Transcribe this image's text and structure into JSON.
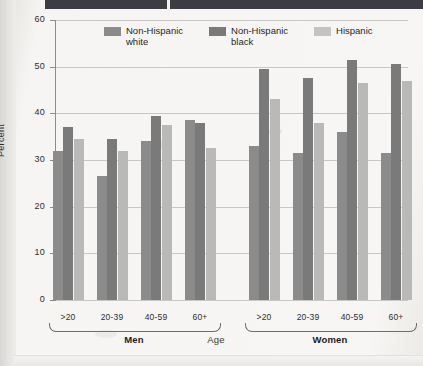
{
  "chart_data": {
    "type": "bar",
    "title": "",
    "xlabel": "Age",
    "ylabel": "Percent",
    "ylim": [
      0,
      60
    ],
    "yticks": [
      0,
      10,
      20,
      30,
      40,
      50,
      60
    ],
    "grid": true,
    "legend_position": "top-center",
    "categories": [
      ">20",
      "20-39",
      "40-59",
      "60+",
      ">20",
      "20-39",
      "40-59",
      "60+"
    ],
    "groups": [
      {
        "label": "Men",
        "categories": [
          ">20",
          "20-39",
          "40-59",
          "60+"
        ]
      },
      {
        "label": "Women",
        "categories": [
          ">20",
          "20-39",
          "40-59",
          "60+"
        ]
      }
    ],
    "series": [
      {
        "name": "Non-Hispanic white",
        "color": "#8b8b8b",
        "values": [
          32,
          26.5,
          34,
          38.5,
          33,
          31.5,
          36,
          31.5
        ]
      },
      {
        "name": "Non-Hispanic black",
        "color": "#7a7a7a",
        "values": [
          37,
          34.5,
          39.5,
          38,
          49.5,
          47.5,
          51.5,
          50.5
        ]
      },
      {
        "name": "Hispanic",
        "color": "#b9b9b7",
        "values": [
          34.5,
          32,
          37.5,
          32.5,
          43,
          38,
          46.5,
          47
        ]
      }
    ]
  },
  "axis": {
    "y_title": "Percent",
    "x_title": "Age",
    "y_tick_labels": [
      "60",
      "50",
      "40",
      "30",
      "20",
      "10",
      "0"
    ]
  },
  "legend": {
    "items": [
      {
        "label": "Non-Hispanic\nwhite",
        "swatch": "swatch-nonhispanic-white"
      },
      {
        "label": "Non-Hispanic\nblack",
        "swatch": "swatch-nonhispanic-black"
      },
      {
        "label": "Hispanic",
        "swatch": "swatch-hispanic"
      }
    ]
  },
  "x_axis_groups": [
    {
      "label": "Men",
      "ticks": [
        ">20",
        "20-39",
        "40-59",
        "60+"
      ]
    },
    {
      "label": "Women",
      "ticks": [
        ">20",
        "20-39",
        "40-59",
        "60+"
      ]
    }
  ],
  "colors": {
    "series_white": "#8b8b8b",
    "series_black": "#7a7a7a",
    "series_hispanic": "#b9b9b7",
    "grid": "#c9c7c3",
    "axis": "#8e8c88",
    "page": "#f6f5f3",
    "header_bar": "#3b3d42"
  }
}
